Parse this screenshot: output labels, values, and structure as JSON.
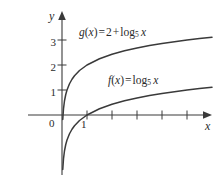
{
  "figure": {
    "name": "logarithmic-functions-graph",
    "background_color": "#ffffff",
    "ink_color": "#3a3a3a",
    "text_color": "#2b2b2b"
  },
  "axes": {
    "x_axis_label": "x",
    "y_axis_label": "y",
    "origin_label": "0",
    "x_tick_labels": [
      "1"
    ],
    "y_tick_labels": [
      "1",
      "2",
      "3"
    ],
    "x_unlabeled_tick_count": 4,
    "arrowheads": [
      "x-positive",
      "y-positive"
    ]
  },
  "labels": {
    "g": {
      "fname": "g",
      "arg": "x",
      "equals": "=",
      "constant": "2",
      "plus": "+",
      "log": "log",
      "base": "5",
      "logarg": "x"
    },
    "f": {
      "fname": "f",
      "arg": "x",
      "equals": "=",
      "log": "log",
      "base": "5",
      "logarg": "x"
    }
  },
  "chart_data": {
    "type": "line",
    "title": "",
    "xlabel": "x",
    "ylabel": "y",
    "xlim": [
      -0.2,
      6.4
    ],
    "ylim": [
      -2.2,
      3.6
    ],
    "grid": false,
    "legend": "inline-curve-labels",
    "x_ticks": [
      1,
      2,
      3,
      4,
      5
    ],
    "x_tick_labels": [
      "1",
      "",
      "",
      "",
      ""
    ],
    "y_ticks": [
      1,
      2,
      3
    ],
    "y_tick_labels": [
      "1",
      "2",
      "3"
    ],
    "series": [
      {
        "name": "f(x) = log_5 x",
        "expression": "log_5(x)",
        "base": 5,
        "vertical_shift": 0,
        "color": "#3a3a3a",
        "x": [
          0.03,
          0.06,
          0.1,
          0.15,
          0.2,
          0.3,
          0.4,
          0.5,
          0.7,
          1.0,
          1.5,
          2.0,
          2.5,
          3.0,
          3.5,
          4.0,
          4.5,
          5.0,
          5.5,
          6.0
        ],
        "y": [
          -2.18,
          -1.75,
          -1.43,
          -1.18,
          -1.0,
          -0.75,
          -0.57,
          -0.43,
          -0.22,
          0.0,
          0.25,
          0.43,
          0.57,
          0.68,
          0.78,
          0.86,
          0.93,
          1.0,
          1.06,
          1.11
        ]
      },
      {
        "name": "g(x) = 2 + log_5 x",
        "expression": "2 + log_5(x)",
        "base": 5,
        "vertical_shift": 2,
        "color": "#3a3a3a",
        "x": [
          0.03,
          0.06,
          0.1,
          0.15,
          0.2,
          0.3,
          0.4,
          0.5,
          0.7,
          1.0,
          1.5,
          2.0,
          2.5,
          3.0,
          3.5,
          4.0,
          4.5,
          5.0,
          5.5,
          6.0
        ],
        "y": [
          -0.18,
          0.25,
          0.57,
          0.82,
          1.0,
          1.25,
          1.43,
          1.57,
          1.78,
          2.0,
          2.25,
          2.43,
          2.57,
          2.68,
          2.78,
          2.86,
          2.93,
          3.0,
          3.06,
          3.11
        ]
      }
    ],
    "annotations": [
      {
        "text": "g(x) = 2 + log_5 x",
        "attached_to": "g(x) = 2 + log_5 x"
      },
      {
        "text": "f(x) = log_5 x",
        "attached_to": "f(x) = log_5 x"
      }
    ],
    "asymptote": {
      "type": "vertical",
      "x": 0
    }
  }
}
